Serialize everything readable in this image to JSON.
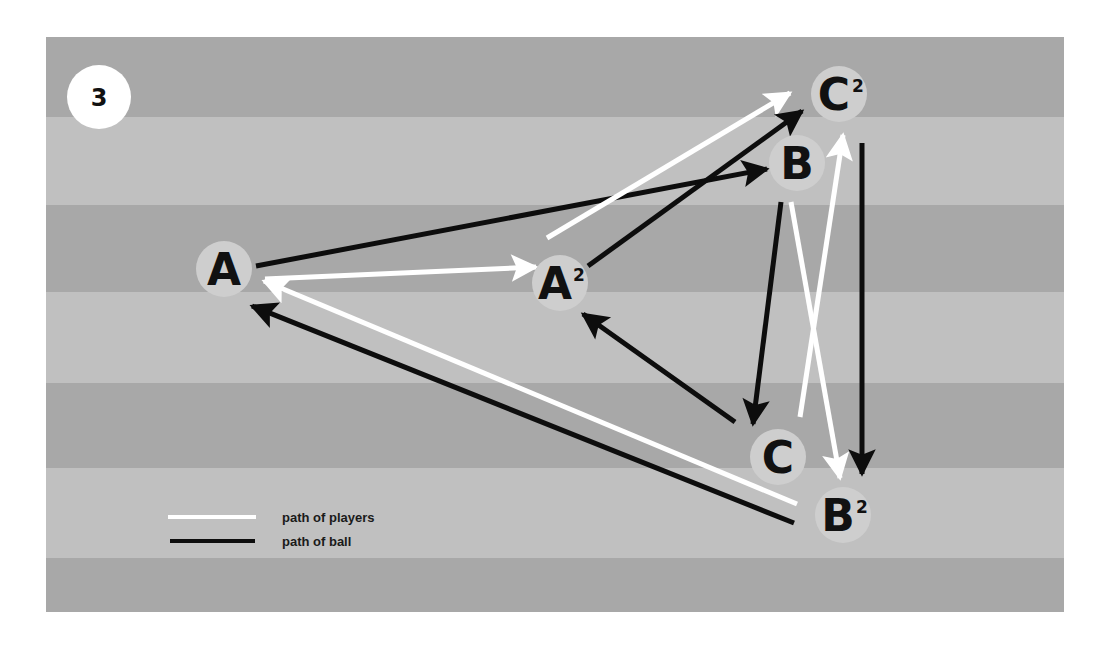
{
  "badge": {
    "number": "3"
  },
  "colors": {
    "stripe_dark": "#a8a8a8",
    "stripe_light": "#c0c0c0",
    "node_fill": "#cecece",
    "player_path": "#ffffff",
    "ball_path": "#0d0d0d",
    "badge_fill": "#ffffff",
    "text": "#111111"
  },
  "field": {
    "x": 46,
    "y": 37,
    "width": 1018,
    "height": 575,
    "stripes": [
      {
        "y": 37,
        "h": 80,
        "tone": "dark"
      },
      {
        "y": 117,
        "h": 88,
        "tone": "light"
      },
      {
        "y": 205,
        "h": 87,
        "tone": "dark"
      },
      {
        "y": 292,
        "h": 91,
        "tone": "light"
      },
      {
        "y": 383,
        "h": 85,
        "tone": "dark"
      },
      {
        "y": 468,
        "h": 90,
        "tone": "light"
      },
      {
        "y": 558,
        "h": 54,
        "tone": "dark"
      }
    ]
  },
  "nodes": [
    {
      "id": "A",
      "label": "A",
      "sup": "",
      "x": 224,
      "y": 269
    },
    {
      "id": "A2",
      "label": "A",
      "sup": "2",
      "x": 560,
      "y": 283
    },
    {
      "id": "B",
      "label": "B",
      "sup": "",
      "x": 797,
      "y": 163
    },
    {
      "id": "C2",
      "label": "C",
      "sup": "2",
      "x": 839,
      "y": 94
    },
    {
      "id": "C",
      "label": "C",
      "sup": "",
      "x": 778,
      "y": 457
    },
    {
      "id": "B2",
      "label": "B",
      "sup": "2",
      "x": 843,
      "y": 515
    }
  ],
  "paths": [
    {
      "type": "ball",
      "from": "A",
      "to": "B",
      "x1": 256,
      "y1": 266,
      "x2": 767,
      "y2": 169
    },
    {
      "type": "player",
      "from": "A",
      "to": "A2",
      "x1": 265,
      "y1": 279,
      "x2": 536,
      "y2": 267
    },
    {
      "type": "player",
      "from": "A2",
      "to": "C2",
      "x1": 547,
      "y1": 238,
      "x2": 790,
      "y2": 93
    },
    {
      "type": "ball",
      "from": "A2",
      "to": "C2",
      "x1": 588,
      "y1": 266,
      "x2": 802,
      "y2": 111
    },
    {
      "type": "ball",
      "from": "B",
      "to": "C",
      "x1": 781,
      "y1": 202,
      "x2": 753,
      "y2": 424
    },
    {
      "type": "player",
      "from": "B",
      "to": "B2",
      "x1": 791,
      "y1": 202,
      "x2": 840,
      "y2": 478
    },
    {
      "type": "player",
      "from": "C",
      "to": "C2",
      "x1": 800,
      "y1": 417,
      "x2": 843,
      "y2": 135
    },
    {
      "type": "ball",
      "from": "C2",
      "to": "B2",
      "x1": 862,
      "y1": 143,
      "x2": 862,
      "y2": 474
    },
    {
      "type": "ball",
      "from": "C",
      "to": "A2",
      "x1": 735,
      "y1": 422,
      "x2": 583,
      "y2": 314
    },
    {
      "type": "player",
      "from": "B2",
      "to": "A",
      "x1": 797,
      "y1": 504,
      "x2": 264,
      "y2": 281
    },
    {
      "type": "ball",
      "from": "B2",
      "to": "A",
      "x1": 794,
      "y1": 523,
      "x2": 252,
      "y2": 306
    }
  ],
  "legend": {
    "items": [
      {
        "type": "player",
        "label": "path of players"
      },
      {
        "type": "ball",
        "label": "path of ball"
      }
    ]
  }
}
